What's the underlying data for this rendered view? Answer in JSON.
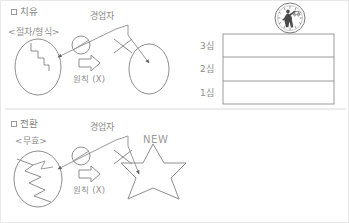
{
  "document": {
    "title": "하자의 치유 / 무효행위의 전환 도해",
    "language": "ko"
  },
  "colors": {
    "stroke": "#8e8e8e",
    "stroke_dark": "#6f6f6f",
    "text": "#8a8a8a",
    "table_border": "#9a9a9a",
    "divider": "#d8d8d8",
    "page_background": "#ffffff",
    "seal": "#4a4a4a"
  },
  "sections": [
    {
      "id": "section-cure",
      "heading": "치유",
      "checkbox": "□",
      "source_label": "<절차/형식>",
      "actor_label": "경업자",
      "rule_label": "원칙 (X)",
      "source_shape": "ellipse-with-step-crack",
      "target_shape": "ellipse-empty",
      "blocked": true,
      "block_marker": "X"
    },
    {
      "id": "section-conversion",
      "heading": "전환",
      "checkbox": "□",
      "source_label": "<무효>",
      "actor_label": "경업자",
      "rule_label": "원칙 (X)",
      "target_badge": "NEW",
      "source_shape": "ellipse-with-lightning-crack",
      "target_shape": "six-point-star",
      "blocked": true,
      "block_marker": "X"
    }
  ],
  "court_table": {
    "emblem_name": "court-seal-emblem",
    "rows": [
      {
        "label": "3심",
        "value": ""
      },
      {
        "label": "2심",
        "value": ""
      },
      {
        "label": "1심",
        "value": ""
      }
    ]
  }
}
